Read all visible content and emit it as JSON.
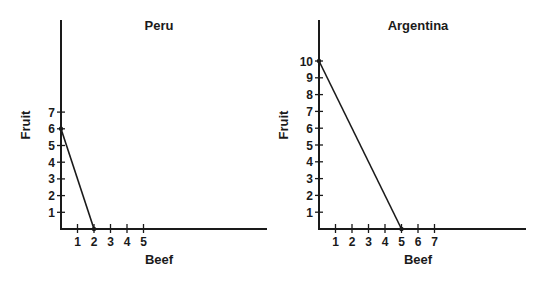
{
  "chart_data": [
    {
      "type": "line",
      "title": "Peru",
      "xlabel": "Beef",
      "ylabel": "Fruit",
      "x_ticks": [
        "1",
        "2",
        "3",
        "4",
        "5"
      ],
      "y_ticks": [
        "1",
        "2",
        "3",
        "4",
        "5",
        "6",
        "7"
      ],
      "series": [
        {
          "name": "Production possibilities frontier",
          "x": [
            0,
            2
          ],
          "y": [
            6,
            0
          ]
        }
      ],
      "grid": false
    },
    {
      "type": "line",
      "title": "Argentina",
      "xlabel": "Beef",
      "ylabel": "Fruit",
      "x_ticks": [
        "1",
        "2",
        "3",
        "4",
        "5",
        "6",
        "7"
      ],
      "y_ticks": [
        "1",
        "2",
        "3",
        "4",
        "5",
        "6",
        "7",
        "8",
        "9",
        "10"
      ],
      "series": [
        {
          "name": "Production possibilities frontier",
          "x": [
            0,
            5
          ],
          "y": [
            10,
            0
          ]
        }
      ],
      "grid": false
    }
  ]
}
